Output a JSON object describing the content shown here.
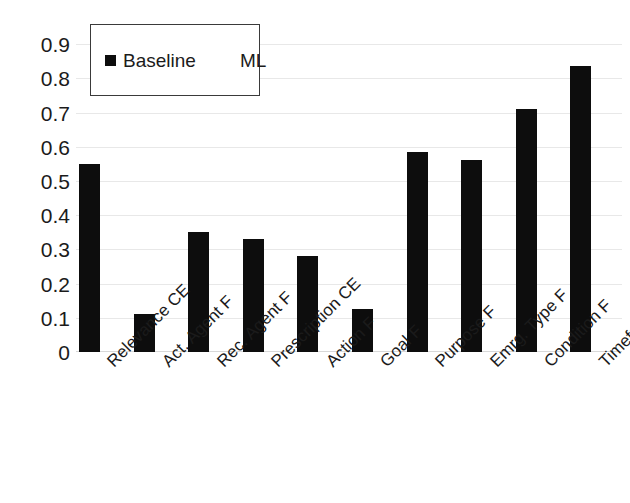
{
  "chart_data": {
    "type": "bar",
    "title": "",
    "xlabel": "",
    "ylabel": "",
    "ylim": [
      0,
      0.9
    ],
    "grid": true,
    "legend_position": "top-left",
    "categories": [
      "Relevance CE",
      "Act. Agent F",
      "Rec. Agent F",
      "Prescription CE",
      "Action F",
      "Goal F",
      "Purpose F",
      "Emrg. Type F",
      "Condition F",
      "Timeframe F"
    ],
    "series": [
      {
        "name": "Baseline",
        "color": "#0d0d0d",
        "values": [
          0.55,
          0.11,
          0.35,
          0.33,
          0.28,
          0.125,
          0.585,
          0.56,
          0.71,
          0.835
        ]
      },
      {
        "name": "ML",
        "color": "#ffffff",
        "values": [
          0,
          0,
          0,
          0,
          0,
          0,
          0,
          0,
          0,
          0
        ]
      }
    ],
    "ytick_labels": [
      "0.9",
      "0.8",
      "0.7",
      "0.6",
      "0.5",
      "0.4",
      "0.3",
      "0.2",
      "0.1",
      "0"
    ],
    "ytick_values": [
      0.9,
      0.8,
      0.7,
      0.6,
      0.5,
      0.4,
      0.3,
      0.2,
      0.1,
      0
    ]
  },
  "legend": {
    "entries": [
      {
        "label": "Baseline",
        "swatch": "filled"
      },
      {
        "label": "ML",
        "swatch": "empty"
      }
    ]
  }
}
